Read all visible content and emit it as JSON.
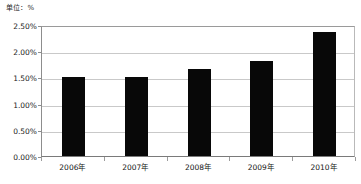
{
  "chart_data": {
    "type": "bar",
    "title": "",
    "unit_label": "单位：%",
    "xlabel": "",
    "ylabel": "",
    "categories": [
      "2006年",
      "2007年",
      "2008年",
      "2009年",
      "2010年"
    ],
    "values": [
      1.5,
      1.5,
      1.66,
      1.81,
      2.37
    ],
    "ylim": [
      0.0,
      2.5
    ],
    "ytick_values": [
      0.0,
      0.5,
      1.0,
      1.5,
      2.0,
      2.5
    ],
    "ytick_labels": [
      "0.00%",
      "0.50%",
      "1.00%",
      "1.50%",
      "2.00%",
      "2.50%"
    ],
    "grid": true,
    "legend": null,
    "series": [
      {
        "name": "",
        "values": [
          1.5,
          1.5,
          1.66,
          1.81,
          2.37
        ],
        "color": "#080808"
      }
    ],
    "colors": {
      "bar": "#080808",
      "gridline": "#c9c9c9",
      "axis": "#8d8d8d",
      "background": "#ffffff",
      "text": "#151515"
    }
  }
}
